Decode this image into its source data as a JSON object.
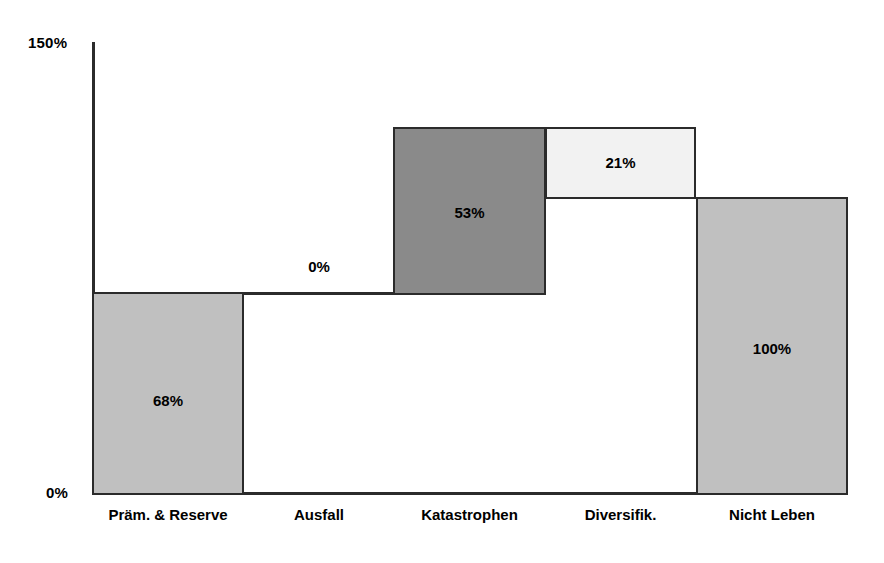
{
  "chart_data": {
    "type": "bar",
    "subtype": "waterfall",
    "title": "",
    "xlabel": "",
    "ylabel": "",
    "ylim": [
      0,
      150
    ],
    "grid": false,
    "legend": null,
    "y_ticks": [
      "0%",
      "150%"
    ],
    "y_tick_values": [
      0,
      150
    ],
    "categories": [
      "Präm. & Reserve",
      "Ausfall",
      "Katastrophen",
      "Diversifik.",
      "Nicht Leben"
    ],
    "values": [
      68,
      0,
      53,
      21,
      100
    ],
    "data_labels": [
      "68%",
      "0%",
      "53%",
      "21%",
      "100%"
    ],
    "bars": [
      {
        "category": "Präm. & Reserve",
        "label": "68%",
        "value": 68,
        "base": 0,
        "top": 68,
        "kind": "increase",
        "fill": "#c0c0c0",
        "geometry": {
          "x": 92,
          "y": 292,
          "width": 152,
          "height": 203
        },
        "label_pos": {
          "x": 92,
          "y": 392,
          "width": 152
        }
      },
      {
        "category": "Ausfall",
        "label": "0%",
        "value": 0,
        "base": 68,
        "top": 68,
        "kind": "zero",
        "fill": "#2b2b2b",
        "geometry": {
          "x": 244,
          "y": 292,
          "width": 150,
          "height": 3
        },
        "label_pos": {
          "x": 244,
          "y": 258,
          "width": 150
        }
      },
      {
        "category": "Katastrophen",
        "label": "53%",
        "value": 53,
        "base": 68,
        "top": 121,
        "kind": "increase",
        "fill": "#8a8a8a",
        "geometry": {
          "x": 393,
          "y": 127,
          "width": 153,
          "height": 168
        },
        "label_pos": {
          "x": 393,
          "y": 204,
          "width": 153
        }
      },
      {
        "category": "Diversifik.",
        "label": "21%",
        "value": 21,
        "base": 100,
        "top": 121,
        "kind": "decrease",
        "fill": "#f2f2f2",
        "geometry": {
          "x": 545,
          "y": 127,
          "width": 151,
          "height": 72
        },
        "label_pos": {
          "x": 545,
          "y": 154,
          "width": 151
        }
      },
      {
        "category": "Nicht Leben",
        "label": "100%",
        "value": 100,
        "base": 0,
        "top": 100,
        "kind": "total",
        "fill": "#c0c0c0",
        "geometry": {
          "x": 696,
          "y": 197,
          "width": 152,
          "height": 298
        },
        "label_pos": {
          "x": 696,
          "y": 340,
          "width": 152
        }
      }
    ],
    "category_label_pos": [
      {
        "x": 92,
        "width": 152
      },
      {
        "x": 244,
        "width": 150
      },
      {
        "x": 393,
        "width": 153
      },
      {
        "x": 545,
        "width": 151
      },
      {
        "x": 696,
        "width": 152
      }
    ]
  },
  "axis": {
    "y_top_label": "150%",
    "y_bottom_label": "0%"
  },
  "colors": {
    "axis": "#2b2b2b",
    "outline": "#2b2b2b",
    "text": "#000000",
    "background": "#ffffff",
    "fill_light_gray": "#c0c0c0",
    "fill_dark_gray": "#8a8a8a",
    "fill_pale": "#f2f2f2"
  }
}
